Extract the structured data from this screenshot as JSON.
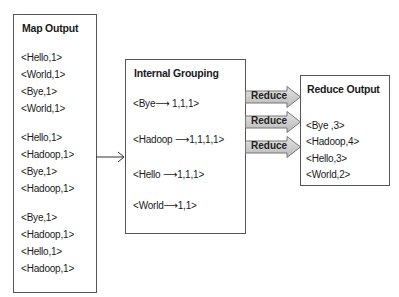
{
  "map_output": {
    "title": "Map Output",
    "groups": [
      [
        "<Hello,1>",
        "<World,1>",
        "<Bye,1>",
        "<World,1>"
      ],
      [
        "<Hello,1>",
        "<Hadoop,1>",
        "<Bye,1>",
        "<Hadoop,1>"
      ],
      [
        "<Bye,1>",
        "<Hadoop,1>",
        "<Hello,1>",
        "<Hadoop,1>"
      ]
    ]
  },
  "internal_grouping": {
    "title": "Internal Grouping",
    "rows": [
      {
        "key": "<Bye",
        "arrow": "⟶",
        "values": "1,1,1>"
      },
      {
        "key": "<Hadoop",
        "arrow": "⟶",
        "values": "1,1,1,1>"
      },
      {
        "key": "<Hello",
        "arrow": "⟶",
        "values": "1,1,1>"
      },
      {
        "key": "<World",
        "arrow": "⟶",
        "values": "1,1>"
      }
    ]
  },
  "reduce_arrows": {
    "labels": [
      "Reduce",
      "Reduce",
      "Reduce"
    ],
    "fill_color": "#c8c8c8",
    "stroke_color": "#777777"
  },
  "reduce_output": {
    "title": "Reduce Output",
    "lines": [
      "<Bye ,3>",
      "<Hadoop,4>",
      "<Hello,3>",
      "<World,2>"
    ]
  }
}
